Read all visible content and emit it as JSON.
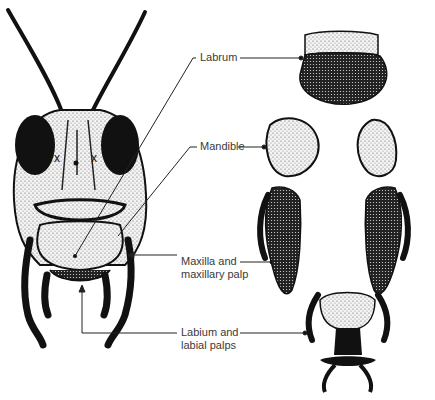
{
  "figure": {
    "labels": [
      {
        "id": "labrum",
        "text": "Labrum"
      },
      {
        "id": "mandible",
        "text": "Mandible"
      },
      {
        "id": "maxilla",
        "line1": "Maxilla and",
        "line2": "maxillary palp"
      },
      {
        "id": "labium",
        "line1": "Labium and",
        "line2": "labial palps"
      }
    ],
    "colors": {
      "ink": "#111111",
      "stipple": "#555555",
      "label": "#3a3a3a",
      "background": "#ffffff"
    }
  }
}
